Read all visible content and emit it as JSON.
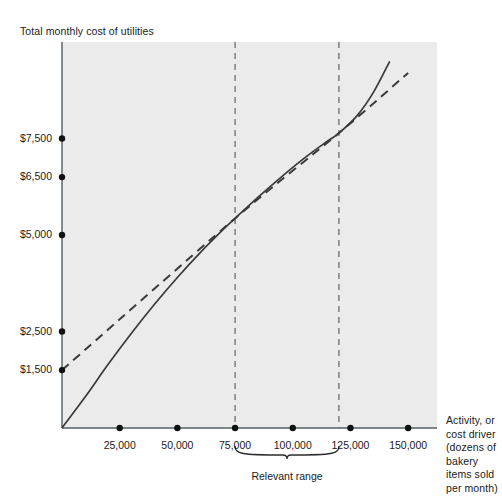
{
  "chart_data": {
    "type": "line",
    "title": "",
    "ylabel": "Total monthly cost of utilities",
    "xlabel": "Activity, or cost driver (dozens of bakery items sold per month)",
    "xlabel_lines": [
      "Activity, or",
      "cost driver",
      "(dozens of",
      "bakery items",
      "sold per",
      "month)"
    ],
    "grid": false,
    "legend": "none",
    "xlim": [
      0,
      162500
    ],
    "ylim": [
      0,
      10000
    ],
    "xticks": [
      25000,
      50000,
      75000,
      100000,
      125000,
      150000
    ],
    "xtick_labels": [
      "25,000",
      "50,000",
      "75,000",
      "100,000",
      "125,000",
      "150,000"
    ],
    "yticks": [
      1500,
      2500,
      5000,
      6500,
      7500
    ],
    "ytick_labels": [
      "$1,500",
      "$2,500",
      "$5,000",
      "$6,500",
      "$7,500"
    ],
    "annotations": [
      {
        "name": "relevant-range",
        "label": "Relevant range",
        "x_start": 75000,
        "x_end": 120000
      }
    ],
    "reference_lines": [
      {
        "name": "relevant-range-lower-bound",
        "x": 75000,
        "style": "dashed"
      },
      {
        "name": "relevant-range-upper-bound",
        "x": 120000,
        "style": "dashed"
      }
    ],
    "series": [
      {
        "name": "actual-cost-curve",
        "style": "solid",
        "color": "#3a3a3a",
        "points": [
          [
            0,
            0
          ],
          [
            10000,
            800
          ],
          [
            20000,
            1650
          ],
          [
            30000,
            2450
          ],
          [
            40000,
            3200
          ],
          [
            50000,
            3900
          ],
          [
            60000,
            4550
          ],
          [
            70000,
            5150
          ],
          [
            75000,
            5430
          ],
          [
            85000,
            5980
          ],
          [
            95000,
            6500
          ],
          [
            105000,
            6990
          ],
          [
            115000,
            7430
          ],
          [
            120000,
            7640
          ],
          [
            128000,
            8100
          ],
          [
            135000,
            8700
          ],
          [
            142000,
            9500
          ],
          [
            147000,
            10150
          ]
        ]
      },
      {
        "name": "straight-line-cost-approximation",
        "style": "dashed",
        "color": "#3a3a3a",
        "points": [
          [
            0,
            1500
          ],
          [
            75000,
            5430
          ],
          [
            120000,
            7640
          ],
          [
            150000,
            9200
          ]
        ]
      }
    ]
  },
  "labels": {
    "relevant_range": "Relevant range"
  }
}
